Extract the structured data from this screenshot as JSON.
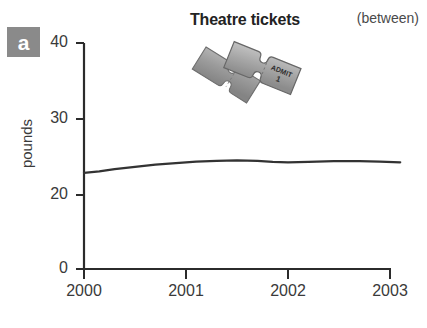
{
  "panel": {
    "badge_letter": "a"
  },
  "header": {
    "title": "Theatre tickets",
    "corner_note": "(between)"
  },
  "illustration": {
    "name": "theatre-ticket-icon",
    "ticket_text_line1": "ADMIT",
    "ticket_text_line2": "1"
  },
  "colors": {
    "badge_background": "#8a8a8a",
    "line": "#333333",
    "axis": "#2b2b2b",
    "text": "#3a3a3a",
    "background": "#ffffff",
    "ticket_fill": "#9a9a9a",
    "ticket_shadow": "#6f6f6f"
  },
  "chart_data": {
    "type": "line",
    "title": "Theatre tickets",
    "xlabel": "",
    "ylabel": "pounds",
    "xlim": [
      2000,
      2003.1
    ],
    "ylim": [
      0,
      40
    ],
    "grid": false,
    "legend": "none",
    "axis_note": "y-axis broken between 0 and 20; no tick drawn at 10",
    "yticks": [
      40,
      30,
      20,
      0
    ],
    "ytick_labels": [
      "40",
      "30",
      "20",
      "0"
    ],
    "xticks": [
      2000,
      2001,
      2002,
      2003
    ],
    "xtick_labels": [
      "2000",
      "2001",
      "2002",
      "2003"
    ],
    "series": [
      {
        "name": "Theatre tickets",
        "x": [
          2000.0,
          2000.15,
          2000.3,
          2000.5,
          2000.7,
          2000.9,
          2001.1,
          2001.3,
          2001.5,
          2001.7,
          2001.85,
          2002.0,
          2002.2,
          2002.45,
          2002.7,
          2002.9,
          2003.1
        ],
        "values": [
          22.9,
          23.1,
          23.4,
          23.7,
          24.0,
          24.2,
          24.4,
          24.5,
          24.55,
          24.5,
          24.35,
          24.3,
          24.35,
          24.45,
          24.45,
          24.4,
          24.3
        ]
      }
    ]
  }
}
